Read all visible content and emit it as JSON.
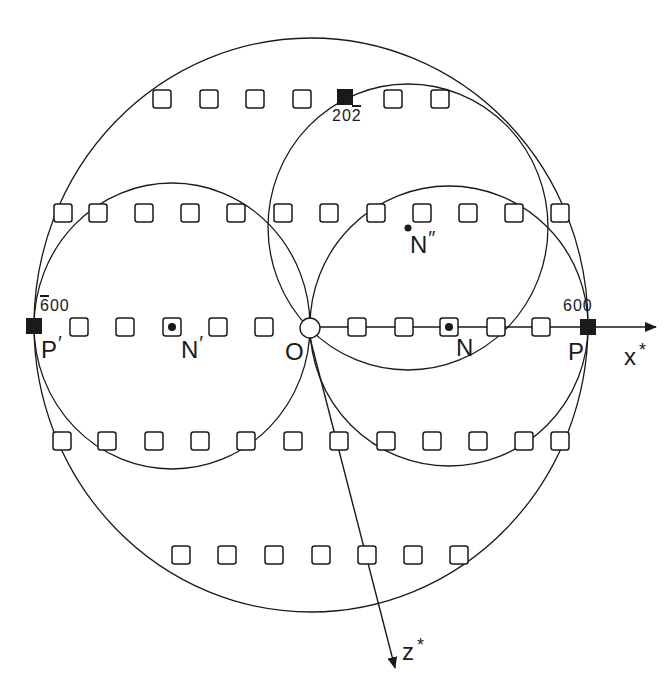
{
  "diagram": {
    "type": "reciprocal-lattice Ewald construction",
    "colors": {
      "ink": "#1a1a1a",
      "background": "#ffffff"
    },
    "axes": [
      {
        "name": "x*",
        "label": "x",
        "superscript": "*",
        "from": [
          310,
          327
        ],
        "to": [
          656,
          327
        ]
      },
      {
        "name": "z*",
        "label": "z",
        "superscript": "*",
        "from": [
          310,
          338
        ],
        "to": [
          395,
          668
        ]
      }
    ],
    "origin": {
      "label": "O",
      "x": 310,
      "y": 328,
      "r": 10
    },
    "points": {
      "P": {
        "label": "P",
        "prime": "",
        "index": "600",
        "index_bar": "",
        "x": 588,
        "y": 327
      },
      "Pp": {
        "label": "P",
        "prime": "′",
        "index_bar_char": "6",
        "index_rest": "00",
        "x": 34,
        "y": 326
      },
      "R": {
        "index_a": "20",
        "index_bar_char": "2",
        "x": 345,
        "y": 97
      },
      "N": {
        "label": "N",
        "prime": "",
        "x": 449,
        "y": 327
      },
      "Np": {
        "label": "N",
        "prime": "′",
        "x": 172,
        "y": 327
      },
      "Npp": {
        "label": "N",
        "prime": "″",
        "x": 408,
        "y": 228
      }
    },
    "circles": [
      {
        "name": "outer-circle",
        "cx": 311,
        "cy": 325,
        "rx": 277,
        "ry": 287
      },
      {
        "name": "circle-n-prime",
        "cx": 172,
        "cy": 326,
        "rx": 138,
        "ry": 143
      },
      {
        "name": "circle-n",
        "cx": 449,
        "cy": 326,
        "rx": 139,
        "ry": 140
      },
      {
        "name": "circle-n-double-prime",
        "cx": 408,
        "cy": 227,
        "rx": 140,
        "ry": 143
      }
    ],
    "lattice_rows": [
      {
        "y": 99,
        "x": [
          162,
          209,
          255,
          302,
          393,
          440
        ]
      },
      {
        "y": 213,
        "x": [
          63,
          98,
          144,
          190,
          236,
          283,
          329,
          376,
          422,
          468,
          514,
          560
        ]
      },
      {
        "y": 327,
        "x": [
          79,
          125,
          172,
          218,
          264,
          357,
          404,
          449,
          496,
          541
        ]
      },
      {
        "y": 441,
        "x": [
          62,
          107,
          154,
          200,
          246,
          293,
          339,
          386,
          432,
          478,
          524,
          560
        ]
      },
      {
        "y": 555,
        "x": [
          181,
          227,
          274,
          321,
          367,
          413,
          459
        ]
      }
    ],
    "filled_squares": [
      {
        "name": "P",
        "x": 588,
        "y": 327
      },
      {
        "name": "Pp",
        "x": 34,
        "y": 326
      },
      {
        "name": "R",
        "x": 345,
        "y": 97
      }
    ],
    "dot_squares": [
      {
        "x": 172,
        "y": 327
      },
      {
        "x": 449,
        "y": 327
      }
    ],
    "free_dots": [
      {
        "x": 408,
        "y": 228
      }
    ]
  }
}
